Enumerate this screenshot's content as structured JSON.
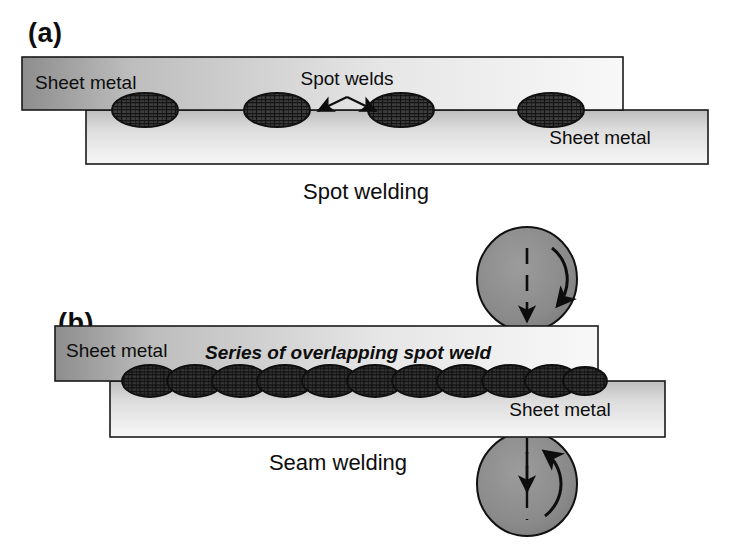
{
  "figure": {
    "width": 730,
    "height": 549,
    "background": "#ffffff"
  },
  "colors": {
    "sheet_light": "#f2f2f2",
    "sheet_mid": "#c9c9c9",
    "sheet_dark": "#8f8f8f",
    "outline": "#1a1a1a",
    "nugget_fill": "#3a3a3a",
    "nugget_hatch": "#151515",
    "roller_fill": "#8a8a8a",
    "roller_outline": "#111111",
    "arrow": "#0d0d0d",
    "text": "#0d0d0d"
  },
  "panels": [
    {
      "id": "a",
      "label": "(a)",
      "caption": "Spot welding",
      "upper_sheet_label": "Sheet metal",
      "lower_sheet_label": "Sheet metal",
      "callout": "Spot welds",
      "nugget_count": 4,
      "nuggets": [
        {
          "cx": 145,
          "cy": 110,
          "rx": 33,
          "ry": 17
        },
        {
          "cx": 277,
          "cy": 110,
          "rx": 33,
          "ry": 17
        },
        {
          "cx": 401,
          "cy": 110,
          "rx": 33,
          "ry": 17
        },
        {
          "cx": 551,
          "cy": 110,
          "rx": 33,
          "ry": 17
        }
      ],
      "upper_sheet": {
        "x": 22,
        "y": 57,
        "w": 601,
        "h": 53
      },
      "lower_sheet": {
        "x": 86,
        "y": 110,
        "w": 622,
        "h": 54
      },
      "arrows": [
        {
          "from_x": 347,
          "from_y": 99,
          "to_x": 316,
          "to_y": 112
        },
        {
          "from_x": 347,
          "from_y": 99,
          "to_x": 378,
          "to_y": 112
        }
      ]
    },
    {
      "id": "b",
      "label": "(b)",
      "caption": "Seam welding",
      "upper_sheet_label": "Sheet metal",
      "lower_sheet_label": "Sheet metal",
      "callout": "Series of overlapping spot weld",
      "seam_nugget_count": 11,
      "seam": {
        "start_x": 130,
        "end_x": 595,
        "cy": 381,
        "ry": 16
      },
      "upper_sheet": {
        "x": 55,
        "y": 326,
        "w": 543,
        "h": 55
      },
      "lower_sheet": {
        "x": 110,
        "y": 381,
        "w": 555,
        "h": 56
      },
      "rollers": [
        {
          "name": "upper-roller-electrode",
          "cx": 527,
          "cy": 279,
          "rx": 50,
          "ry": 52,
          "rotation": "clockwise"
        },
        {
          "name": "lower-roller-electrode",
          "cx": 527,
          "cy": 484,
          "rx": 50,
          "ry": 52,
          "rotation": "counter-clockwise"
        }
      ],
      "centerline": {
        "x": 527,
        "y_top": 248,
        "y_bottom": 520
      }
    }
  ]
}
